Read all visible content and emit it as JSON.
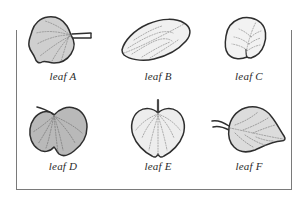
{
  "figure": {
    "frame": {
      "stroke_color": "#7a7a7a",
      "sides_drawn": "left, right, bottom"
    },
    "outline_color": "#2e2e2e",
    "vein_color": "#9a9a9a",
    "leaves": [
      {
        "id": "a",
        "label": "leaf A",
        "shape": "rounded heart-shaped blade with slightly lobed margin",
        "fill_color": "#cfcfcf",
        "stem": "short, projecting to the right",
        "venation": "palmate, dotted"
      },
      {
        "id": "b",
        "label": "leaf B",
        "shape": "elongated elliptic blade tilted about -25 degrees",
        "fill_color": "#f0f0f0",
        "stem": "none visible",
        "venation": "pinnate, dotted"
      },
      {
        "id": "c",
        "label": "leaf C",
        "shape": "small rounded ovate blade with pointed tip",
        "fill_color": "#f2f2f2",
        "stem": "very short at base",
        "venation": "pinnate, dotted"
      },
      {
        "id": "d",
        "label": "leaf D",
        "shape": "broad cordate heart-shaped blade",
        "fill_color": "#b9b9b9",
        "stem": "slender, angled up to the left",
        "venation": "palmate, dotted"
      },
      {
        "id": "e",
        "label": "leaf E",
        "shape": "symmetric cordate heart-shaped blade",
        "fill_color": "#ededed",
        "stem": "straight, vertical at the top",
        "venation": "palmate, dotted"
      },
      {
        "id": "f",
        "label": "leaf F",
        "shape": "ovate blade tilted with tip to the right",
        "fill_color": "#dcdcdc",
        "stem": "bent, angled up to the left",
        "venation": "pinnate, dotted"
      }
    ]
  }
}
